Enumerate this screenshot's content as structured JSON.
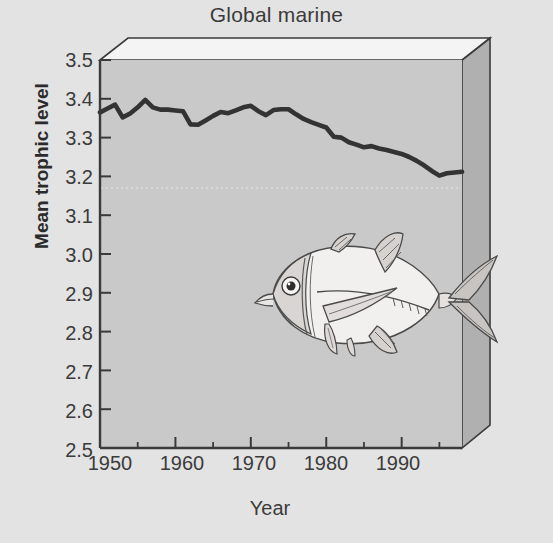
{
  "chart_data": {
    "type": "line",
    "title": "Global marine",
    "xlabel": "Year",
    "ylabel": "Mean trophic level",
    "xlim": [
      1950,
      1998
    ],
    "ylim": [
      2.5,
      3.5
    ],
    "grid": false,
    "legend": null,
    "x_major_ticks": [
      1950,
      1960,
      1970,
      1980,
      1990
    ],
    "x_minor_ticks": [
      1955,
      1965,
      1975,
      1985,
      1995
    ],
    "x_tick_labels": [
      "1950",
      "1960",
      "1970",
      "1980",
      "1990"
    ],
    "y_ticks": [
      2.5,
      2.6,
      2.7,
      2.8,
      2.9,
      3.0,
      3.1,
      3.2,
      3.3,
      3.4,
      3.5
    ],
    "y_tick_labels": [
      "2.5",
      "2.6",
      "2.7",
      "2.8",
      "2.9",
      "3.0",
      "3.1",
      "3.2",
      "3.3",
      "3.4",
      "3.5"
    ],
    "reference_line_y": 3.17,
    "series": [
      {
        "name": "Mean trophic level of global marine fisheries landings",
        "x": [
          1950,
          1951,
          1952,
          1953,
          1954,
          1955,
          1956,
          1957,
          1958,
          1959,
          1960,
          1961,
          1962,
          1963,
          1964,
          1965,
          1966,
          1967,
          1968,
          1969,
          1970,
          1971,
          1972,
          1973,
          1974,
          1975,
          1976,
          1977,
          1978,
          1979,
          1980,
          1981,
          1982,
          1983,
          1984,
          1985,
          1986,
          1987,
          1988,
          1989,
          1990,
          1991,
          1992,
          1993,
          1994,
          1995,
          1996,
          1997,
          1998
        ],
        "values": [
          3.365,
          3.375,
          3.385,
          3.352,
          3.362,
          3.378,
          3.397,
          3.378,
          3.372,
          3.372,
          3.37,
          3.368,
          3.334,
          3.333,
          3.344,
          3.356,
          3.366,
          3.363,
          3.37,
          3.378,
          3.382,
          3.368,
          3.358,
          3.371,
          3.373,
          3.373,
          3.36,
          3.348,
          3.34,
          3.333,
          3.326,
          3.302,
          3.3,
          3.288,
          3.282,
          3.275,
          3.278,
          3.272,
          3.268,
          3.263,
          3.258,
          3.25,
          3.24,
          3.228,
          3.214,
          3.202,
          3.208,
          3.21,
          3.212
        ]
      }
    ]
  },
  "figure": {
    "title": "Global marine",
    "xlabel": "Year",
    "ylabel": "Mean trophic level",
    "fish_illustration_label": "fish-illustration"
  },
  "colors": {
    "page_background": "#e3e3e3",
    "plot_background": "#c9c9c9",
    "box_top_face": "#f4f4f4",
    "box_side_face": "#b0b0b0",
    "axis_line": "#3a3a3a",
    "data_line": "#333333",
    "text": "#3b3b3b"
  }
}
